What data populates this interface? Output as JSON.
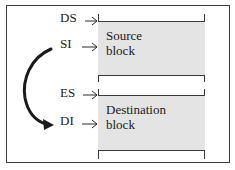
{
  "diagram": {
    "registers": [
      {
        "id": "ds",
        "label": "DS"
      },
      {
        "id": "si",
        "label": "SI"
      },
      {
        "id": "es",
        "label": "ES"
      },
      {
        "id": "di",
        "label": "DI"
      }
    ],
    "blocks": [
      {
        "id": "source",
        "label_line1": "Source",
        "label_line2": "block",
        "fill": "#e4e4e4"
      },
      {
        "id": "destination",
        "label_line1": "Destination",
        "label_line2": "block",
        "fill": "#e4e4e4"
      }
    ],
    "curved_arrow": {
      "from": "SI",
      "to": "DI"
    }
  }
}
